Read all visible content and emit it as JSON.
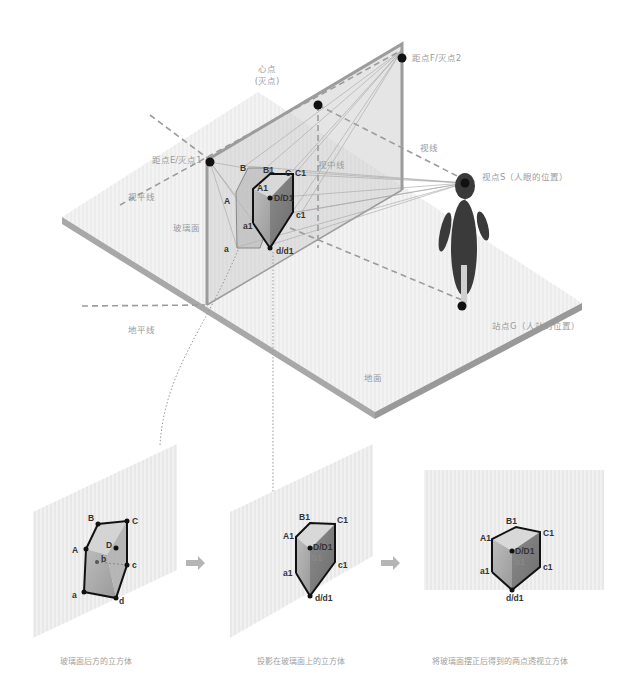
{
  "diagram": {
    "labels": {
      "center_point": "心点",
      "center_point_sub": "(灭点)",
      "distance_point_f": "距点F/灭点2",
      "distance_point_e": "距点E/灭点1",
      "sight_line": "视线",
      "horizon_line": "视平线",
      "center_line": "视中线",
      "glass_plane": "玻璃面",
      "ground_line": "地平线",
      "ground": "地面",
      "viewpoint": "视点S（人眼的位置）",
      "standpoint": "站点G（人站的位置）"
    },
    "cube_points_main": {
      "B": "B",
      "B1": "B1",
      "C": "C",
      "C1": "C1",
      "A": "A",
      "A1": "A1",
      "D_D1": "D/D1",
      "b1": "b1",
      "a1": "a1",
      "c1": "c1",
      "a": "a",
      "d_d1": "d/d1"
    },
    "panels": [
      {
        "caption": "玻璃面后方的立方体",
        "points": {
          "B": "B",
          "C": "C",
          "A": "A",
          "D": "D",
          "b": "b",
          "c": "c",
          "a": "a",
          "d": "d"
        }
      },
      {
        "caption": "投影在玻璃面上的立方体",
        "points": {
          "B1": "B1",
          "C1": "C1",
          "A1": "A1",
          "D_D1": "D/D1",
          "b1": "b1",
          "a1": "a1",
          "c1": "c1",
          "d_d1": "d/d1"
        }
      },
      {
        "caption": "将玻璃面摆正后得到的两点透视立方体",
        "points": {
          "B1": "B1",
          "C1": "C1",
          "A1": "A1",
          "D_D1": "D/D1",
          "b1": "b1",
          "a1": "a1",
          "c1": "c1",
          "d_d1": "d/d1"
        }
      }
    ],
    "arrows": [
      "arrow-right",
      "arrow-right"
    ],
    "colors": {
      "ground": "#ececec",
      "ground_edge": "#a8a8a8",
      "glass": "#d6d6d6",
      "glass_edge": "#9c9c9c",
      "figure": "#3a3a3a",
      "label": "#9a9a9a",
      "point": "#111111"
    }
  }
}
